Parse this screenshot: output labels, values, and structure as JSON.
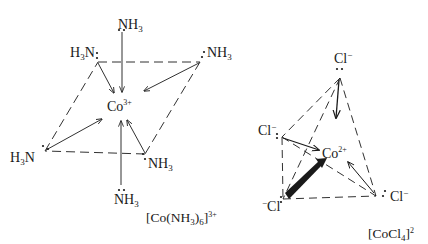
{
  "figure": {
    "left_complex": {
      "name": "[Co(NH3)6]3+",
      "geometry": "octahedral",
      "center_ion": {
        "symbol": "Co",
        "charge": "3+"
      },
      "ligands": [
        {
          "position": "top",
          "text": "NH",
          "sub": "3"
        },
        {
          "position": "upper-left",
          "pre_sub_prefix": "H",
          "sub": "3",
          "text": "N"
        },
        {
          "position": "upper-right",
          "text": "NH",
          "sub": "3"
        },
        {
          "position": "lower-left",
          "pre_sub_prefix": "H",
          "sub": "3",
          "text": "N"
        },
        {
          "position": "lower-right",
          "text": "NH",
          "sub": "3"
        },
        {
          "position": "bottom",
          "text": "NH",
          "sub": "3"
        }
      ],
      "caption": {
        "open": "[Co(NH",
        "sub": "3",
        "close": ")",
        "sub2": "6",
        "bracket": "]",
        "sup": "3+"
      }
    },
    "right_complex": {
      "name": "[CoCl4]2-",
      "geometry": "tetrahedral",
      "center_ion": {
        "symbol": "Co",
        "charge": "2+"
      },
      "ligands": [
        {
          "position": "top",
          "text": "Cl",
          "sup": "−"
        },
        {
          "position": "left",
          "text": "Cl",
          "sup": "−"
        },
        {
          "position": "bottom-left",
          "text": "Cl",
          "pre_sup": "−"
        },
        {
          "position": "right",
          "text": "Cl",
          "sup": "−"
        }
      ],
      "caption": {
        "open": "[CoCl",
        "sub": "4",
        "bracket": "]",
        "sup": "2"
      }
    }
  },
  "colors": {
    "ink": "#1a1a1a",
    "background": "#ffffff"
  }
}
